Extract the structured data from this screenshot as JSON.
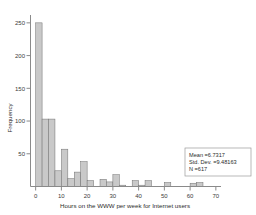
{
  "chart_data": {
    "type": "bar",
    "title": "",
    "subtitle": "",
    "xlabel": "Hours on the WWW per week for Internet users",
    "ylabel": "Frequency",
    "xlim": [
      -2,
      72
    ],
    "ylim": [
      0,
      262
    ],
    "grid": false,
    "legend": null,
    "bin_width": 2.5,
    "xticks": [
      0,
      10,
      20,
      30,
      40,
      50,
      60,
      70
    ],
    "xtick_labels": [
      "0",
      "10",
      "20",
      "30",
      "40",
      "50",
      "60",
      "70"
    ],
    "yticks": [
      50,
      100,
      150,
      200,
      250
    ],
    "ytick_labels": [
      "50",
      "100",
      "150",
      "200",
      "250"
    ],
    "bin_starts": [
      0,
      2.5,
      5,
      7.5,
      10,
      12.5,
      15,
      17.5,
      20,
      22.5,
      25,
      27.5,
      30,
      32.5,
      35,
      37.5,
      40,
      42.5,
      45,
      47.5,
      50,
      52.5,
      55,
      57.5,
      60,
      62.5,
      65,
      67.5
    ],
    "values": [
      250,
      103,
      103,
      24,
      57,
      12,
      22,
      38,
      9,
      0,
      11,
      7,
      18,
      2,
      0,
      9,
      2,
      9,
      0,
      0,
      6,
      0,
      0,
      0,
      5,
      6,
      0,
      0
    ],
    "annotations": {
      "mean_label": "Mean =6.7317",
      "std_label": "Std. Dev. =9.48163",
      "n_label": "N =617",
      "mean_value": 6.7317,
      "std_dev_value": 9.48163,
      "n_value": 617
    },
    "colors": {
      "bar_fill": "#c9c9c9",
      "bar_stroke": "#6f6f6f",
      "axis": "#8a8a8a",
      "text": "#2b2b2b",
      "background": "#ffffff"
    }
  }
}
